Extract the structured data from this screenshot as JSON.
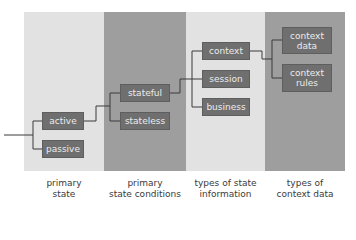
{
  "columns": [
    {
      "label_line1": "primary",
      "label_line2": "state",
      "shade": "light"
    },
    {
      "label_line1": "primary",
      "label_line2": "state conditions",
      "shade": "dark"
    },
    {
      "label_line1": "types of state",
      "label_line2": "information",
      "shade": "light"
    },
    {
      "label_line1": "types of",
      "label_line2": "context data",
      "shade": "dark"
    }
  ],
  "nodes": {
    "active": "active",
    "passive": "passive",
    "stateful": "stateful",
    "stateless": "stateless",
    "context": "context",
    "session": "session",
    "business": "business",
    "context_data_1": "context",
    "context_data_2": "data",
    "context_rules_1": "context",
    "context_rules_2": "rules"
  },
  "colors": {
    "light_column": "#e2e2e2",
    "dark_column": "#9e9e9e",
    "box": "#6f6f6f",
    "box_text": "#ececec",
    "line": "#3a3a3a"
  }
}
